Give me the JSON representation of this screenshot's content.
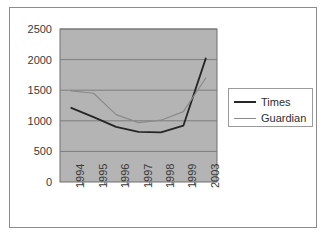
{
  "chart_data": {
    "type": "line",
    "title": "",
    "xlabel": "",
    "ylabel": "",
    "categories": [
      "1994",
      "1995",
      "1996",
      "1997",
      "1998",
      "1999",
      "2003"
    ],
    "series": [
      {
        "name": "Times",
        "color": "#262626",
        "values": [
          1210,
          1060,
          900,
          820,
          810,
          920,
          2020
        ]
      },
      {
        "name": "Guardian",
        "color": "#8a8a8a",
        "values": [
          1490,
          1450,
          1100,
          970,
          1010,
          1150,
          1700
        ]
      }
    ],
    "ylim": [
      0,
      2500
    ],
    "yticks": [
      0,
      500,
      1000,
      1500,
      2000,
      2500
    ],
    "ytick_labels": [
      "0",
      "500",
      "1000",
      "1500",
      "2000",
      "2500"
    ],
    "grid": true,
    "legend_position": "right",
    "plot_background": "#b4b4b4",
    "gridline_color": "#7d7d7d",
    "frame_color": "#8c8c8c"
  }
}
